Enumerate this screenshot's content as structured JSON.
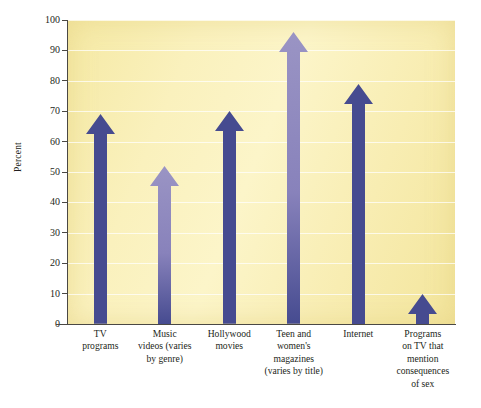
{
  "chart_data": {
    "type": "bar",
    "title": "",
    "subtitle": "",
    "xlabel": "",
    "ylabel": "Percent",
    "ylim": [
      0,
      100
    ],
    "ytick_step": 10,
    "yticks": [
      100,
      90,
      80,
      70,
      60,
      50,
      40,
      30,
      20,
      10,
      0
    ],
    "grid": true,
    "legend": "none",
    "categories": [
      "TV programs",
      "Music videos (varies by genre)",
      "Hollywood movies",
      "Teen and women's magazines (varies by title)",
      "Internet",
      "Programs on TV that mention consequences of sex"
    ],
    "category_label_lines": [
      [
        "TV",
        "programs"
      ],
      [
        "Music",
        "videos (varies",
        "by genre)"
      ],
      [
        "Hollywood",
        "movies"
      ],
      [
        "Teen and",
        "women's",
        "magazines",
        "(varies by title)"
      ],
      [
        "Internet"
      ],
      [
        "Programs",
        "on TV that",
        "mention",
        "consequences",
        "of sex"
      ]
    ],
    "values": [
      69,
      52,
      70,
      96,
      79,
      10
    ],
    "bar_style": "upward-arrow",
    "series": [
      {
        "name": "Percent",
        "values": [
          69,
          52,
          70,
          96,
          79,
          10
        ]
      }
    ]
  },
  "colors": {
    "arrow_dark": "#464b90",
    "arrow_light": "#9a94c4",
    "plot_background": "#f8efb4",
    "gridline": "#ffffff",
    "axis": "#4a4844",
    "text": "#231f20",
    "page_background": "#ffffff"
  }
}
